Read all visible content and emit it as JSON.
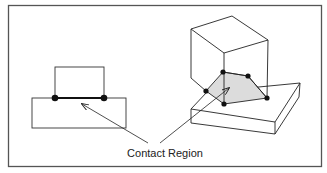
{
  "figure": {
    "label": "Contact Region",
    "colors": {
      "line": "#222222",
      "frame": "#555555",
      "contact_fill": "#dcdcdc",
      "dot": "#111111"
    },
    "views": [
      {
        "name": "2D side view",
        "contact": "line segment"
      },
      {
        "name": "3D isometric view",
        "contact": "shaded polygon"
      }
    ]
  }
}
